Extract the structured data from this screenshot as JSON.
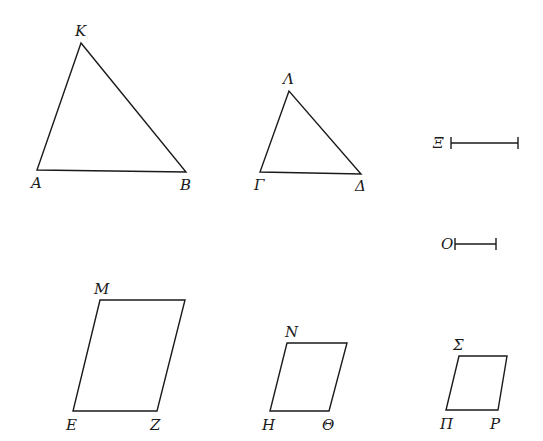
{
  "figure": {
    "ink_color": "#1a1a1a",
    "background": "#ffffff"
  },
  "triangles": [
    {
      "name": "AKB",
      "vertices": {
        "K": [
          81,
          43
        ],
        "A": [
          37,
          170
        ],
        "B": [
          186,
          172
        ]
      },
      "labels": [
        {
          "text": "K",
          "x": 75,
          "y": 36
        },
        {
          "text": "A",
          "x": 31,
          "y": 188
        },
        {
          "text": "B",
          "x": 180,
          "y": 190
        }
      ]
    },
    {
      "name": "ΓΛΔ",
      "vertices": {
        "Λ": [
          289,
          91
        ],
        "Γ": [
          260,
          172
        ],
        "Δ": [
          361,
          174
        ]
      },
      "labels": [
        {
          "text": "Λ",
          "x": 283,
          "y": 84
        },
        {
          "text": "Γ",
          "x": 254,
          "y": 190
        },
        {
          "text": "Δ",
          "x": 355,
          "y": 191
        }
      ]
    }
  ],
  "segments": [
    {
      "name": "Ξ",
      "from": [
        451,
        143
      ],
      "to": [
        518,
        143
      ],
      "label": {
        "text": "Ξ",
        "x": 433,
        "y": 148
      }
    },
    {
      "name": "O",
      "from": [
        455,
        244
      ],
      "to": [
        496,
        244
      ],
      "label": {
        "text": "O",
        "x": 441,
        "y": 249
      }
    }
  ],
  "parallelograms": [
    {
      "name": "EMZ",
      "points": [
        [
          100,
          300
        ],
        [
          185,
          300
        ],
        [
          157,
          411
        ],
        [
          73,
          411
        ]
      ],
      "labels": [
        {
          "text": "M",
          "x": 94,
          "y": 294
        },
        {
          "text": "E",
          "x": 66,
          "y": 430
        },
        {
          "text": "Z",
          "x": 150,
          "y": 430
        }
      ]
    },
    {
      "name": "HNΘ",
      "points": [
        [
          287,
          343
        ],
        [
          347,
          343
        ],
        [
          329,
          411
        ],
        [
          270,
          411
        ]
      ],
      "labels": [
        {
          "text": "N",
          "x": 285,
          "y": 337
        },
        {
          "text": "H",
          "x": 262,
          "y": 430
        },
        {
          "text": "Θ",
          "x": 322,
          "y": 430
        }
      ]
    },
    {
      "name": "ΠΣP",
      "points": [
        [
          459,
          356
        ],
        [
          507,
          356
        ],
        [
          498,
          410
        ],
        [
          446,
          410
        ]
      ],
      "labels": [
        {
          "text": "Σ",
          "x": 453,
          "y": 350
        },
        {
          "text": "Π",
          "x": 440,
          "y": 429
        },
        {
          "text": "P",
          "x": 490,
          "y": 429
        }
      ]
    }
  ]
}
